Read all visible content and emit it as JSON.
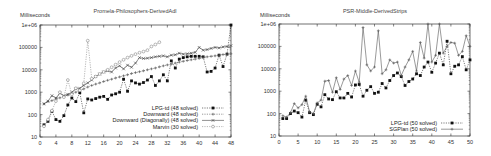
{
  "chart_data": [
    {
      "type": "line",
      "title": "Promela-Philosophers-DerivedAdl",
      "xlabel": "",
      "ylabel": "Milliseconds",
      "yscale": "log",
      "ylim": [
        10,
        1000000
      ],
      "xlim": [
        0,
        48
      ],
      "xticks": [
        "0",
        "4",
        "8",
        "12",
        "16",
        "20",
        "24",
        "28",
        "32",
        "36",
        "40",
        "44",
        "48"
      ],
      "yticks": [
        "10",
        "100",
        "1000",
        "10000",
        "100000",
        "1e+06"
      ],
      "legend_position": "lower right",
      "grid": false,
      "series": [
        {
          "name": "LPG-td (48 solved)",
          "marker": "filled-square",
          "line": "dotted",
          "x": [
            1,
            2,
            3,
            4,
            5,
            6,
            7,
            8,
            9,
            10,
            11,
            12,
            13,
            14,
            15,
            16,
            17,
            18,
            19,
            20,
            21,
            22,
            23,
            24,
            25,
            26,
            27,
            28,
            29,
            30,
            31,
            32,
            33,
            34,
            35,
            36,
            37,
            38,
            39,
            40,
            41,
            42,
            43,
            44,
            45,
            46,
            47,
            48
          ],
          "y": [
            35,
            50,
            140,
            60,
            50,
            90,
            270,
            550,
            380,
            950,
            120,
            500,
            450,
            520,
            600,
            650,
            480,
            750,
            850,
            1000,
            3800,
            1100,
            3200,
            2600,
            2300,
            2700,
            3500,
            5000,
            2000,
            3200,
            6000,
            3200,
            25000,
            12000,
            30000,
            35000,
            38000,
            40000,
            40000,
            40000,
            38000,
            8000,
            8500,
            12000,
            45000,
            14000,
            50000,
            1000000
          ]
        },
        {
          "name": "Downward (48 solved)",
          "marker": "plus",
          "line": "dotted",
          "x": [
            1,
            2,
            3,
            4,
            5,
            6,
            7,
            8,
            9,
            10,
            11,
            12,
            13,
            14,
            15,
            16,
            17,
            18,
            19,
            20,
            21,
            22,
            23,
            24,
            25,
            26,
            27,
            28,
            29,
            30,
            31,
            32,
            33,
            34,
            35,
            36,
            37,
            38,
            39,
            40,
            41,
            42,
            43,
            44,
            45,
            46,
            47,
            48
          ],
          "y": [
            300,
            380,
            420,
            500,
            560,
            650,
            750,
            850,
            1000,
            1200,
            1400,
            1700,
            2000,
            2300,
            2600,
            3000,
            3400,
            3800,
            4300,
            4800,
            5400,
            6000,
            6800,
            7500,
            8200,
            9000,
            10000,
            11000,
            12000,
            13500,
            15000,
            16500,
            18000,
            20000,
            22000,
            24000,
            26000,
            28000,
            30000,
            32000,
            35000,
            38000,
            40000,
            42000,
            45000,
            48000,
            50000,
            52000
          ]
        },
        {
          "name": "Downward (Diagonally) (48 solved)",
          "marker": "x",
          "line": "solid",
          "x": [
            1,
            2,
            3,
            4,
            5,
            6,
            7,
            8,
            9,
            10,
            11,
            12,
            13,
            14,
            15,
            16,
            17,
            18,
            19,
            20,
            21,
            22,
            23,
            24,
            25,
            26,
            27,
            28,
            29,
            30,
            31,
            32,
            33,
            34,
            35,
            36,
            37,
            38,
            39,
            40,
            41,
            42,
            43,
            44,
            45,
            46,
            47,
            48
          ],
          "y": [
            300,
            400,
            700,
            550,
            900,
            700,
            800,
            1000,
            1400,
            1500,
            2000,
            2600,
            3500,
            5000,
            6500,
            8000,
            9000,
            8000,
            12000,
            15000,
            11000,
            16000,
            13000,
            20000,
            35000,
            32000,
            33000,
            35000,
            38000,
            40000,
            42000,
            38000,
            45000,
            47000,
            55000,
            50000,
            52000,
            55000,
            60000,
            100000,
            75000,
            80000,
            90000,
            100000,
            95000,
            105000,
            110000,
            120000
          ]
        },
        {
          "name": "Marvin (30 solved)",
          "marker": "open-circle",
          "line": "dotted",
          "x": [
            1,
            2,
            3,
            4,
            5,
            6,
            7,
            8,
            9,
            10,
            11,
            12,
            13,
            14,
            15,
            16,
            17,
            18,
            19,
            20,
            21,
            22,
            23,
            24,
            25,
            26,
            27,
            28,
            29,
            30
          ],
          "y": [
            30,
            60,
            150,
            400,
            1000,
            600,
            3500,
            800,
            1500,
            1200,
            2500,
            200000,
            4000,
            5000,
            6500,
            8000,
            10000,
            13000,
            17000,
            22000,
            28000,
            35000,
            42000,
            50000,
            58000,
            65000,
            75000,
            110000,
            135000,
            170000
          ]
        }
      ]
    },
    {
      "type": "line",
      "title": "PSR-Middle-DerivedStrips",
      "xlabel": "",
      "ylabel": "Milliseconds",
      "yscale": "log",
      "ylim": [
        10,
        1000000
      ],
      "xlim": [
        0,
        50
      ],
      "xticks": [
        "0",
        "5",
        "10",
        "15",
        "20",
        "25",
        "30",
        "35",
        "40",
        "45",
        "50"
      ],
      "yticks": [
        "10",
        "100",
        "1000",
        "10000",
        "100000",
        "1e+06"
      ],
      "legend_position": "lower right",
      "grid": false,
      "series": [
        {
          "name": "LPG-td (50 solved)",
          "marker": "filled-square",
          "line": "dotted",
          "x": [
            1,
            2,
            3,
            4,
            5,
            6,
            7,
            8,
            9,
            10,
            11,
            12,
            13,
            14,
            15,
            16,
            17,
            18,
            19,
            20,
            21,
            22,
            23,
            24,
            25,
            26,
            27,
            28,
            29,
            30,
            31,
            32,
            33,
            34,
            35,
            36,
            37,
            38,
            39,
            40,
            41,
            42,
            43,
            44,
            45,
            46,
            47,
            48,
            49,
            50
          ],
          "y": [
            60,
            60,
            100,
            130,
            110,
            70,
            400,
            110,
            90,
            260,
            200,
            700,
            450,
            420,
            950,
            500,
            500,
            800,
            550,
            1900,
            2000,
            600,
            1100,
            1600,
            800,
            900,
            2200,
            1400,
            3000,
            5000,
            6500,
            4500,
            1800,
            2700,
            3500,
            6000,
            5000,
            12000,
            20000,
            7000,
            18000,
            50000,
            15000,
            170000,
            6000,
            13000,
            15000,
            35000,
            9000,
            25000
          ]
        },
        {
          "name": "SGPlan (50 solved)",
          "marker": "plus",
          "line": "solid",
          "x": [
            1,
            2,
            3,
            4,
            5,
            6,
            7,
            8,
            9,
            10,
            11,
            12,
            13,
            14,
            15,
            16,
            17,
            18,
            19,
            20,
            21,
            22,
            23,
            24,
            25,
            26,
            27,
            28,
            29,
            30,
            31,
            32,
            33,
            34,
            35,
            36,
            37,
            38,
            39,
            40,
            41,
            42,
            43,
            44,
            45,
            46,
            47,
            48,
            49,
            50
          ],
          "y": [
            80,
            70,
            110,
            280,
            180,
            250,
            600,
            120,
            100,
            300,
            400,
            2800,
            3000,
            900,
            4000,
            1200,
            3500,
            5000,
            1800,
            8000,
            2500,
            700000,
            15000,
            8000,
            12000,
            500000,
            6000,
            9000,
            25000,
            18000,
            20000,
            5000,
            12000,
            25000,
            60000,
            8000,
            150000,
            30000,
            1000000,
            20000,
            40000,
            1000000,
            50000,
            100000,
            150000,
            140000,
            40000,
            60000,
            300000,
            100000
          ]
        }
      ]
    }
  ],
  "charts": [
    {
      "title": "Promela-Philosophers-DerivedAdl",
      "ylabel": "Milliseconds",
      "legend": [
        "LPG-td (48  solved)",
        "Downward (48  solved)",
        "Downward (Diagonally) (48  solved)",
        "Marvin (30  solved)"
      ]
    },
    {
      "title": "PSR-Middle-DerivedStrips",
      "ylabel": "Milliseconds",
      "legend": [
        "LPG-td (50  solved)",
        "SGPlan (50  solved)"
      ]
    }
  ],
  "colors": {
    "axis": "#333333",
    "series_dark": "#222222",
    "series_mid": "#555555",
    "series_light": "#888888",
    "background": "#ffffff"
  }
}
